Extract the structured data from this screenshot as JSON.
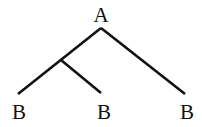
{
  "tree": {
    "root": {
      "label": "A"
    },
    "leaves": [
      {
        "label": "B"
      },
      {
        "label": "B"
      },
      {
        "label": "B"
      }
    ]
  }
}
